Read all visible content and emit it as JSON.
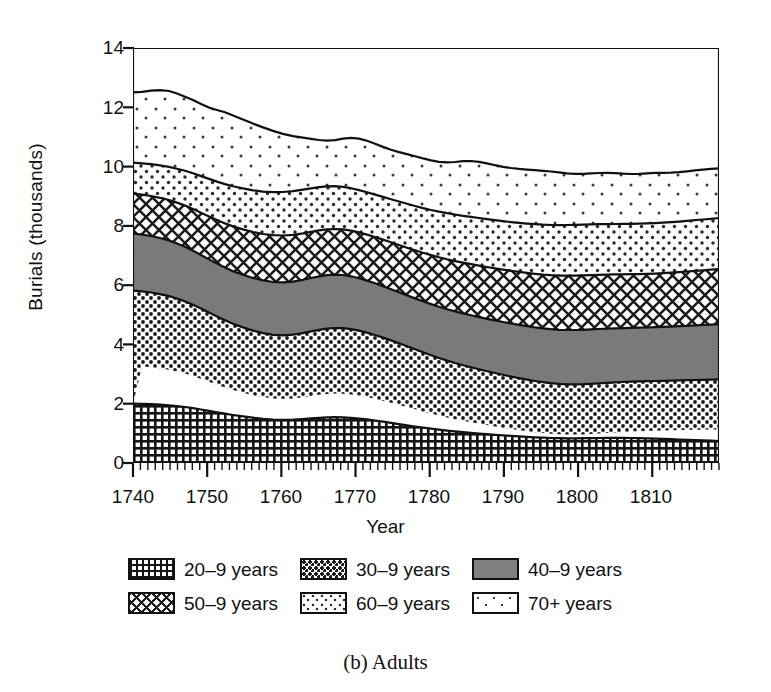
{
  "figure": {
    "caption": "(b) Adults",
    "ylabel": "Burials (thousands)",
    "xlabel": "Year"
  },
  "axes": {
    "y_ticks": [
      "0",
      "2",
      "4",
      "6",
      "8",
      "10",
      "12",
      "14"
    ],
    "x_ticks": [
      "1740",
      "1750",
      "1760",
      "1770",
      "1780",
      "1790",
      "1800",
      "1810"
    ]
  },
  "legend": {
    "items": [
      {
        "label": "20–9 years",
        "pattern": "grid-dense",
        "color": "#1a1a1a"
      },
      {
        "label": "30–9 years",
        "pattern": "dots-dense",
        "color": "#2b2b2b"
      },
      {
        "label": "40–9 years",
        "pattern": "solid-gray",
        "color": "#7a7a7a"
      },
      {
        "label": "50–9 years",
        "pattern": "diamond-net",
        "color": "#222222"
      },
      {
        "label": "60–9 years",
        "pattern": "dots-medium",
        "color": "#555555"
      },
      {
        "label": "70+ years",
        "pattern": "dots-sparse",
        "color": "#777777"
      }
    ]
  },
  "chart_data": {
    "type": "area",
    "stacked": true,
    "title": "(b) Adults",
    "xlabel": "Year",
    "ylabel": "Burials (thousands)",
    "xlim": [
      1740,
      1819
    ],
    "ylim": [
      0,
      14
    ],
    "yticks": [
      0,
      2,
      4,
      6,
      8,
      10,
      12,
      14
    ],
    "xticks": [
      1740,
      1750,
      1760,
      1770,
      1780,
      1790,
      1800,
      1810
    ],
    "grid": false,
    "legend_position": "below-axes",
    "units": "thousands of burials",
    "x": [
      1740,
      1745,
      1750,
      1755,
      1760,
      1765,
      1770,
      1775,
      1780,
      1785,
      1790,
      1795,
      1800,
      1805,
      1810,
      1815,
      1819
    ],
    "series": [
      {
        "name": "20–9 years",
        "values": [
          2.0,
          1.98,
          1.92,
          1.84,
          1.76,
          1.72,
          1.7,
          1.66,
          1.58,
          1.5,
          1.44,
          1.4,
          1.36,
          1.3,
          1.24,
          1.2,
          1.18
        ]
      },
      {
        "name": "30–9 years",
        "values": [
          2.45,
          2.42,
          2.32,
          2.18,
          2.04,
          1.98,
          1.96,
          1.9,
          1.82,
          1.76,
          1.72,
          1.7,
          1.68,
          1.64,
          1.62,
          1.62,
          1.64
        ]
      },
      {
        "name": "40–9 years",
        "values": [
          2.55,
          2.55,
          2.48,
          2.34,
          2.22,
          2.14,
          2.14,
          2.06,
          2.0,
          1.92,
          1.88,
          1.86,
          1.84,
          1.82,
          1.82,
          1.84,
          1.86
        ]
      },
      {
        "name": "50–9 years",
        "values": [
          2.1,
          2.1,
          2.06,
          1.98,
          1.92,
          1.88,
          1.88,
          1.86,
          1.84,
          1.82,
          1.8,
          1.8,
          1.8,
          1.8,
          1.82,
          1.84,
          1.86
        ]
      },
      {
        "name": "60–9 years",
        "values": [
          1.65,
          1.7,
          1.74,
          1.78,
          1.78,
          1.78,
          1.76,
          1.76,
          1.74,
          1.72,
          1.7,
          1.7,
          1.7,
          1.7,
          1.7,
          1.72,
          1.72
        ]
      },
      {
        "name": "70+ years",
        "values": [
          1.75,
          1.78,
          1.76,
          1.72,
          1.66,
          1.62,
          1.64,
          1.58,
          1.52,
          1.5,
          1.5,
          1.52,
          1.54,
          1.54,
          1.56,
          1.6,
          1.64
        ]
      }
    ],
    "cumulative_tops": {
      "20–9 years": [
        2.0,
        1.98,
        1.92,
        1.84,
        1.76,
        1.72,
        1.7,
        1.66,
        1.58,
        1.5,
        1.44,
        1.4,
        1.36,
        1.3,
        1.24,
        1.2,
        1.18
      ],
      "30–9 years": [
        4.45,
        4.4,
        4.24,
        4.02,
        3.8,
        3.7,
        3.66,
        3.56,
        3.4,
        3.26,
        3.16,
        3.1,
        3.04,
        2.94,
        2.86,
        2.82,
        2.82
      ],
      "40–9 years": [
        7.0,
        6.95,
        6.72,
        6.36,
        6.02,
        5.84,
        5.8,
        5.62,
        5.4,
        5.18,
        5.04,
        4.96,
        4.88,
        4.76,
        4.68,
        4.66,
        4.68
      ],
      "50–9 years": [
        9.1,
        9.05,
        8.78,
        8.34,
        7.94,
        7.72,
        7.68,
        7.48,
        7.24,
        7.0,
        6.84,
        6.76,
        6.68,
        6.56,
        6.5,
        6.5,
        6.54
      ],
      "60–9 years": [
        10.75,
        10.75,
        10.52,
        10.12,
        9.72,
        9.5,
        9.44,
        9.24,
        8.98,
        8.72,
        8.54,
        8.46,
        8.38,
        8.26,
        8.2,
        8.22,
        8.26
      ],
      "70+ years": [
        12.5,
        12.53,
        12.28,
        11.84,
        11.38,
        11.12,
        11.08,
        10.82,
        10.5,
        10.22,
        10.04,
        9.98,
        9.92,
        9.8,
        9.76,
        9.82,
        9.9
      ]
    }
  }
}
